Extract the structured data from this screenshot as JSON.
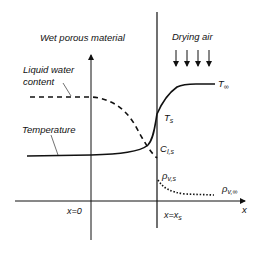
{
  "diagram": {
    "regions": {
      "left": "Wet porous material",
      "right": "Drying air"
    },
    "curves": {
      "liquid_water_label_line1": "Liquid water",
      "liquid_water_label_line2": "content",
      "temperature_label": "Temperature"
    },
    "symbols": {
      "T_inf": "T",
      "T_inf_sub": "∞",
      "T_s": "T",
      "T_s_sub": "s",
      "C_ls": "C",
      "C_ls_sub": "l,s",
      "rho_vs": "ρ",
      "rho_vs_sub": "v,s",
      "rho_vinf": "ρ",
      "rho_vinf_sub": "v,∞"
    },
    "axes": {
      "x_label": "x",
      "origin_label": "x=0",
      "surface_label_main": "x=x",
      "surface_label_sub": "s"
    },
    "arrow_count": 4
  }
}
